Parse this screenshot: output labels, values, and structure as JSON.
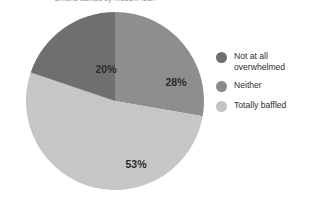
{
  "chart_data": {
    "type": "pie",
    "title": "Britons baffled by modern tech",
    "categories": [
      "Not at all overwhelmed",
      "Totally baffled",
      "Neither"
    ],
    "values": [
      28,
      53,
      20
    ],
    "value_labels": [
      "28%",
      "53%",
      "20%"
    ],
    "unit": "%",
    "start_angle_deg": 0,
    "direction": "clockwise",
    "legend": {
      "position": "right",
      "entries": [
        {
          "label": "Not at all overwhelmed",
          "color": "#6e6e6e",
          "value": 28
        },
        {
          "label": "Neither",
          "color": "#8a8a8a",
          "value": 20
        },
        {
          "label": "Totally baffled",
          "color": "#c2c2c2",
          "value": 53
        }
      ]
    },
    "slices": [
      {
        "label": "Not at all overwhelmed",
        "value": 28,
        "display": "28%",
        "color": "#8e8e8e"
      },
      {
        "label": "Totally baffled",
        "value": 53,
        "display": "53%",
        "color": "#c6c6c6"
      },
      {
        "label": "Neither",
        "value": 20,
        "display": "20%",
        "color": "#6f6f6f"
      }
    ],
    "grid": false,
    "xlabel": "",
    "ylabel": ""
  },
  "colors": {
    "background": "#ffffff",
    "text": "#2e2e2e",
    "slice_dark": "#6f6f6f",
    "slice_mid": "#8e8e8e",
    "slice_light": "#c6c6c6"
  }
}
